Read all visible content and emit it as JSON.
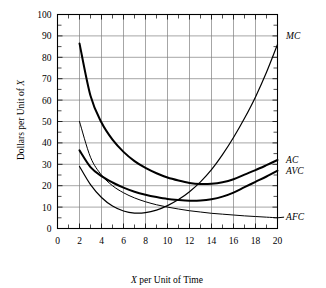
{
  "chart_data": {
    "type": "line",
    "title": "",
    "xlabel": "X per Unit of Time",
    "ylabel": "Dollars per Unit of X",
    "xlim": [
      0,
      20
    ],
    "ylim": [
      0,
      100
    ],
    "xticks": [
      0,
      2,
      4,
      6,
      8,
      10,
      12,
      14,
      16,
      18,
      20
    ],
    "xtick_labels": [
      "0",
      "2",
      "4",
      "6",
      "8",
      "10",
      "12",
      "14",
      "16",
      "18",
      "20"
    ],
    "yticks": [
      0,
      10,
      20,
      30,
      40,
      50,
      60,
      70,
      80,
      90,
      100
    ],
    "ytick_labels": [
      "0",
      "10",
      "20",
      "30",
      "40",
      "50",
      "60",
      "70",
      "80",
      "90",
      "100"
    ],
    "minor_xticks": [
      1,
      3,
      5,
      7,
      9,
      11,
      13,
      15,
      17,
      19
    ],
    "minor_yticks": [
      5,
      15,
      25,
      35,
      45,
      55,
      65,
      75,
      85,
      95
    ],
    "grid": true,
    "grid_color": "#808080",
    "legend_position": "right-of-curve-ends",
    "x": [
      2,
      3,
      4,
      5,
      6,
      7,
      8,
      9,
      10,
      11,
      12,
      13,
      14,
      15,
      16,
      17,
      18,
      19,
      20
    ],
    "series": [
      {
        "name": "AC",
        "label": "AC",
        "color": "#000000",
        "line_width": 2.0,
        "label_x": 20.6,
        "label_y": 32,
        "values": [
          86.5,
          62.0,
          49.5,
          41.5,
          35.8,
          31.5,
          28.3,
          25.8,
          23.8,
          22.4,
          21.3,
          20.8,
          20.9,
          21.6,
          23.0,
          25.2,
          27.3,
          29.6,
          32.0
        ]
      },
      {
        "name": "AVC",
        "label": "AVC",
        "color": "#000000",
        "line_width": 2.0,
        "label_x": 20.6,
        "label_y": 27,
        "values": [
          36.5,
          28.7,
          24.5,
          21.5,
          19.1,
          17.2,
          15.8,
          14.7,
          13.8,
          13.3,
          13.0,
          13.1,
          13.7,
          14.9,
          16.8,
          19.3,
          21.8,
          24.3,
          27.0
        ]
      },
      {
        "name": "AFC",
        "label": "AFC",
        "color": "#000000",
        "line_width": 1.0,
        "label_x": 20.6,
        "label_y": 5.5,
        "values": [
          50.0,
          33.3,
          25.0,
          20.0,
          16.7,
          14.3,
          12.5,
          11.1,
          10.0,
          9.1,
          8.3,
          7.7,
          7.1,
          6.7,
          6.3,
          5.9,
          5.6,
          5.3,
          5.0
        ]
      },
      {
        "name": "MC",
        "label": "MC",
        "color": "#000000",
        "line_width": 1.2,
        "label_x": 20.6,
        "label_y": 90,
        "values": [
          29.0,
          20.5,
          14.5,
          10.5,
          8.2,
          7.2,
          7.4,
          8.6,
          10.7,
          13.5,
          17.2,
          21.8,
          27.5,
          34.5,
          42.5,
          51.5,
          61.5,
          73.0,
          86.0
        ]
      }
    ],
    "annotations": [
      {
        "name": "MC",
        "text": "MC"
      },
      {
        "name": "AC",
        "text": "AC"
      },
      {
        "name": "AVC",
        "text": "AVC"
      },
      {
        "name": "AFC",
        "text": "AFC"
      }
    ]
  },
  "axes": {
    "x_title": "X per Unit of Time",
    "x_title_italic_prefix": "X",
    "x_title_rest": " per Unit of Time",
    "y_title": "Dollars per Unit of X",
    "y_title_main": "Dollars per Unit of ",
    "y_title_italic_suffix": "X"
  },
  "labels": {
    "mc": "MC",
    "ac": "AC",
    "avc": "AVC",
    "afc": "AFC"
  },
  "xticks": {
    "t0": "0",
    "t1": "2",
    "t2": "4",
    "t3": "6",
    "t4": "8",
    "t5": "10",
    "t6": "12",
    "t7": "14",
    "t8": "16",
    "t9": "18",
    "t10": "20"
  },
  "yticks": {
    "t0": "0",
    "t1": "10",
    "t2": "20",
    "t3": "30",
    "t4": "40",
    "t5": "50",
    "t6": "60",
    "t7": "70",
    "t8": "80",
    "t9": "90",
    "t10": "100"
  }
}
